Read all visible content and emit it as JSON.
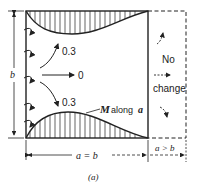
{
  "diagram": {
    "label_b": "b",
    "label_arrow_top": "0.3",
    "label_arrow_mid": "0",
    "label_arrow_bottom": "0.3",
    "label_moment": "M",
    "label_moment_suffix": "along",
    "label_moment_var": "a",
    "label_no": "No",
    "label_change": "change",
    "label_a_eq_b": "a = b",
    "label_a_gt_b": "a > b",
    "caption": "(a)"
  }
}
